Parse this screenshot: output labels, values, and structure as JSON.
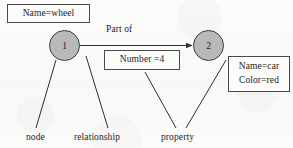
{
  "diagram": {
    "stroke_color": "#3d3d3d",
    "node_fill_color": "#b9b9b9",
    "background_color": "#fbfbf9",
    "nodes": [
      {
        "id": "node-1",
        "label": "1"
      },
      {
        "id": "node-2",
        "label": "2"
      }
    ],
    "edges": [
      {
        "id": "edge-part-of",
        "label": "Part of",
        "from": "node-1",
        "to": "node-2",
        "directed": true
      }
    ],
    "attribute_boxes": [
      {
        "id": "box-wheel",
        "lines": [
          "Name=wheel"
        ]
      },
      {
        "id": "box-number",
        "lines": [
          "Number =4"
        ]
      },
      {
        "id": "box-car",
        "lines": [
          "Name=car",
          "Color=red"
        ]
      }
    ],
    "annotations": [
      {
        "id": "label-node",
        "text": "node"
      },
      {
        "id": "label-relationship",
        "text": "relationship"
      },
      {
        "id": "label-property",
        "text": "property"
      }
    ]
  }
}
